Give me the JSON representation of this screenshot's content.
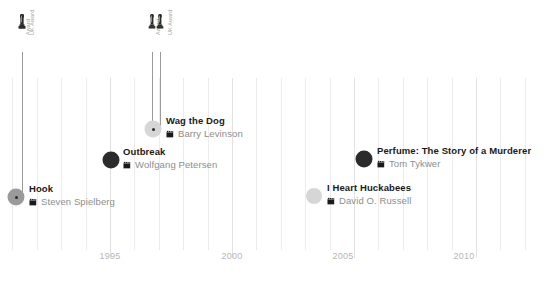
{
  "chart_data": {
    "type": "timeline",
    "title": "",
    "xlabel": "",
    "ylabel": "",
    "xlim": [
      1991,
      2012.5
    ],
    "grid": true,
    "legend": "none",
    "tick_labels": [
      "1995",
      "2000",
      "2005",
      "2010"
    ],
    "tick_values": [
      1995,
      2000,
      2005,
      2010
    ],
    "minor_tick_interval": 1,
    "colors": {
      "marker_dark": "#2b2b2b",
      "marker_mid": "#9a9a9a",
      "marker_light": "#d6d6d6",
      "gridline": "#ececec",
      "axis_text": "#b6b6b6",
      "title_text": "#1a1a1a",
      "director_text": "#8d8d8d",
      "stem": "#9a9a9a"
    },
    "entries": [
      {
        "title": "Hook",
        "director": "Steven Spielberg",
        "year": 1991,
        "marker_shade": "mid",
        "marker_size": 17,
        "has_core_dot": true,
        "has_stem": true,
        "awards": [
          "Award",
          "Award"
        ]
      },
      {
        "title": "Outbreak",
        "director": "Wolfgang Petersen",
        "year": 1995,
        "marker_shade": "dark",
        "marker_size": 17,
        "has_core_dot": false,
        "has_stem": true,
        "awards": []
      },
      {
        "title": "Wag the Dog",
        "director": "Barry Levinson",
        "year": 1997,
        "marker_shade": "light",
        "marker_size": 17,
        "has_core_dot": true,
        "has_stem": true,
        "awards": [
          "Award",
          "Award"
        ]
      },
      {
        "title": "I Heart Huckabees",
        "director": "David O. Russell",
        "year": 2004,
        "marker_shade": "light",
        "marker_size": 16,
        "has_core_dot": false,
        "has_stem": false,
        "awards": []
      },
      {
        "title": "Perfume: The Story of a Murderer",
        "director": "Tom Tykwer",
        "year": 2006,
        "marker_shade": "dark",
        "marker_size": 17,
        "has_core_dot": false,
        "has_stem": false,
        "awards": []
      }
    ]
  },
  "axis": {
    "ticks": [
      {
        "label": "1995",
        "x": 110
      },
      {
        "label": "2000",
        "x": 232
      },
      {
        "label": "2005",
        "x": 343
      },
      {
        "label": "2010",
        "x": 464
      }
    ]
  },
  "awards": [
    {
      "x": 22,
      "icon_y": 14,
      "label": "Award",
      "label_x": 22,
      "label_y": 35,
      "stem_top": 52,
      "stem_bottom": 196
    },
    {
      "x": 22,
      "icon_y": 14,
      "label": "UK Award",
      "label_x": 26,
      "label_y": 35,
      "stem_top": 52,
      "stem_bottom": 196
    },
    {
      "x": 152,
      "icon_y": 14,
      "label": "Award",
      "label_x": 152,
      "label_y": 35,
      "stem_top": 52,
      "stem_bottom": 128
    },
    {
      "x": 160,
      "icon_y": 14,
      "label": "UK Award",
      "label_x": 164,
      "label_y": 35,
      "stem_top": 52,
      "stem_bottom": 128
    }
  ],
  "markers": [
    {
      "name": "hook",
      "x": 16,
      "y": 197,
      "size": 17,
      "shade": "#9a9a9a",
      "core": true
    },
    {
      "name": "outbreak",
      "x": 111,
      "y": 160,
      "size": 17,
      "shade": "#2b2b2b",
      "core": false
    },
    {
      "name": "wag-the-dog",
      "x": 153,
      "y": 129,
      "size": 17,
      "shade": "#d6d6d6",
      "core": true
    },
    {
      "name": "huckabees",
      "x": 314,
      "y": 196,
      "size": 16,
      "shade": "#d6d6d6",
      "core": false
    },
    {
      "name": "perfume",
      "x": 364,
      "y": 159,
      "size": 17,
      "shade": "#2b2b2b",
      "core": false
    }
  ],
  "entries": [
    {
      "title": "Hook",
      "director": "Steven Spielberg",
      "x": 29,
      "y": 183
    },
    {
      "title": "Outbreak",
      "director": "Wolfgang Petersen",
      "x": 123,
      "y": 146
    },
    {
      "title": "Wag the Dog",
      "director": "Barry Levinson",
      "x": 166,
      "y": 115
    },
    {
      "title": "I Heart Huckabees",
      "director": "David O. Russell",
      "x": 327,
      "y": 182
    },
    {
      "title": "Perfume: The Story of a Murderer",
      "director": "Tom Tykwer",
      "x": 377,
      "y": 145
    }
  ]
}
